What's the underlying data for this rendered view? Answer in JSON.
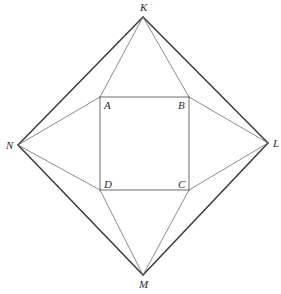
{
  "figure": {
    "background_color": "#ffffff",
    "stroke_color_outer": "#3a3a3a",
    "stroke_color_inner": "#6e6e6e",
    "stroke_color_square": "#5a5a5a",
    "stroke_width_outer": 1.5,
    "stroke_width_inner": 0.8,
    "stroke_width_square": 0.9,
    "label_color": "#2b2b2b",
    "label_font_size": 11
  },
  "points": {
    "K": {
      "label": "K",
      "x": 143,
      "y": 17,
      "label_x": 140,
      "label_y": 11
    },
    "L": {
      "label": "L",
      "x": 268,
      "y": 143,
      "label_x": 273,
      "label_y": 147
    },
    "M": {
      "label": "M",
      "x": 143,
      "y": 275,
      "label_x": 139,
      "label_y": 288
    },
    "N": {
      "label": "N",
      "x": 18,
      "y": 145,
      "label_x": 6,
      "label_y": 149
    },
    "A": {
      "label": "A",
      "x": 100,
      "y": 97,
      "label_x": 104,
      "label_y": 109
    },
    "B": {
      "label": "B",
      "x": 189,
      "y": 97,
      "label_x": 178,
      "label_y": 109
    },
    "C": {
      "label": "C",
      "x": 189,
      "y": 190,
      "label_x": 178,
      "label_y": 188
    },
    "D": {
      "label": "D",
      "x": 100,
      "y": 190,
      "label_x": 104,
      "label_y": 188
    }
  },
  "outer_quadrilateral": {
    "name": "KLMN",
    "vertices": [
      "K",
      "L",
      "M",
      "N"
    ],
    "edges": [
      {
        "name": "edge-KL",
        "from": "K",
        "to": "L"
      },
      {
        "name": "edge-LM",
        "from": "L",
        "to": "M"
      },
      {
        "name": "edge-MN",
        "from": "M",
        "to": "N"
      },
      {
        "name": "edge-NK",
        "from": "N",
        "to": "K"
      }
    ]
  },
  "inner_square": {
    "name": "ABCD",
    "vertices": [
      "A",
      "B",
      "C",
      "D"
    ],
    "edges": [
      {
        "name": "edge-AB",
        "from": "A",
        "to": "B"
      },
      {
        "name": "edge-BC",
        "from": "B",
        "to": "C"
      },
      {
        "name": "edge-CD",
        "from": "C",
        "to": "D"
      },
      {
        "name": "edge-DA",
        "from": "D",
        "to": "A"
      }
    ]
  },
  "connectors": [
    {
      "name": "connector-KA",
      "from": "K",
      "to": "A"
    },
    {
      "name": "connector-KB",
      "from": "K",
      "to": "B"
    },
    {
      "name": "connector-LB",
      "from": "L",
      "to": "B"
    },
    {
      "name": "connector-LC",
      "from": "L",
      "to": "C"
    },
    {
      "name": "connector-MC",
      "from": "M",
      "to": "C"
    },
    {
      "name": "connector-MD",
      "from": "M",
      "to": "D"
    },
    {
      "name": "connector-ND",
      "from": "N",
      "to": "D"
    },
    {
      "name": "connector-NA",
      "from": "N",
      "to": "A"
    }
  ]
}
